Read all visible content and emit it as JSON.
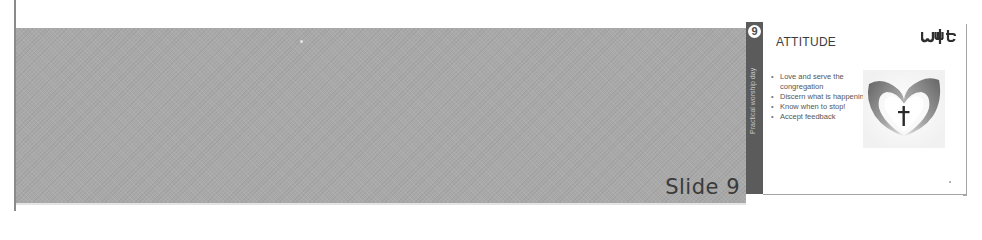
{
  "viewer": {
    "slide_label": "Slide 9",
    "colors": {
      "band": "#a9a9a9",
      "slide_sidebar": "#5b5b5b",
      "rule": "#8a8a8a"
    }
  },
  "slide": {
    "number": "9",
    "sidebar_text": "Practical worship day",
    "title": "ATTITUDE",
    "logo_text": "wlt",
    "bullets": [
      "Love and serve the congregation",
      "Discern what is happening",
      "Know when to stop!",
      "Accept feedback"
    ],
    "image": "hands-heart-cross-icon"
  }
}
